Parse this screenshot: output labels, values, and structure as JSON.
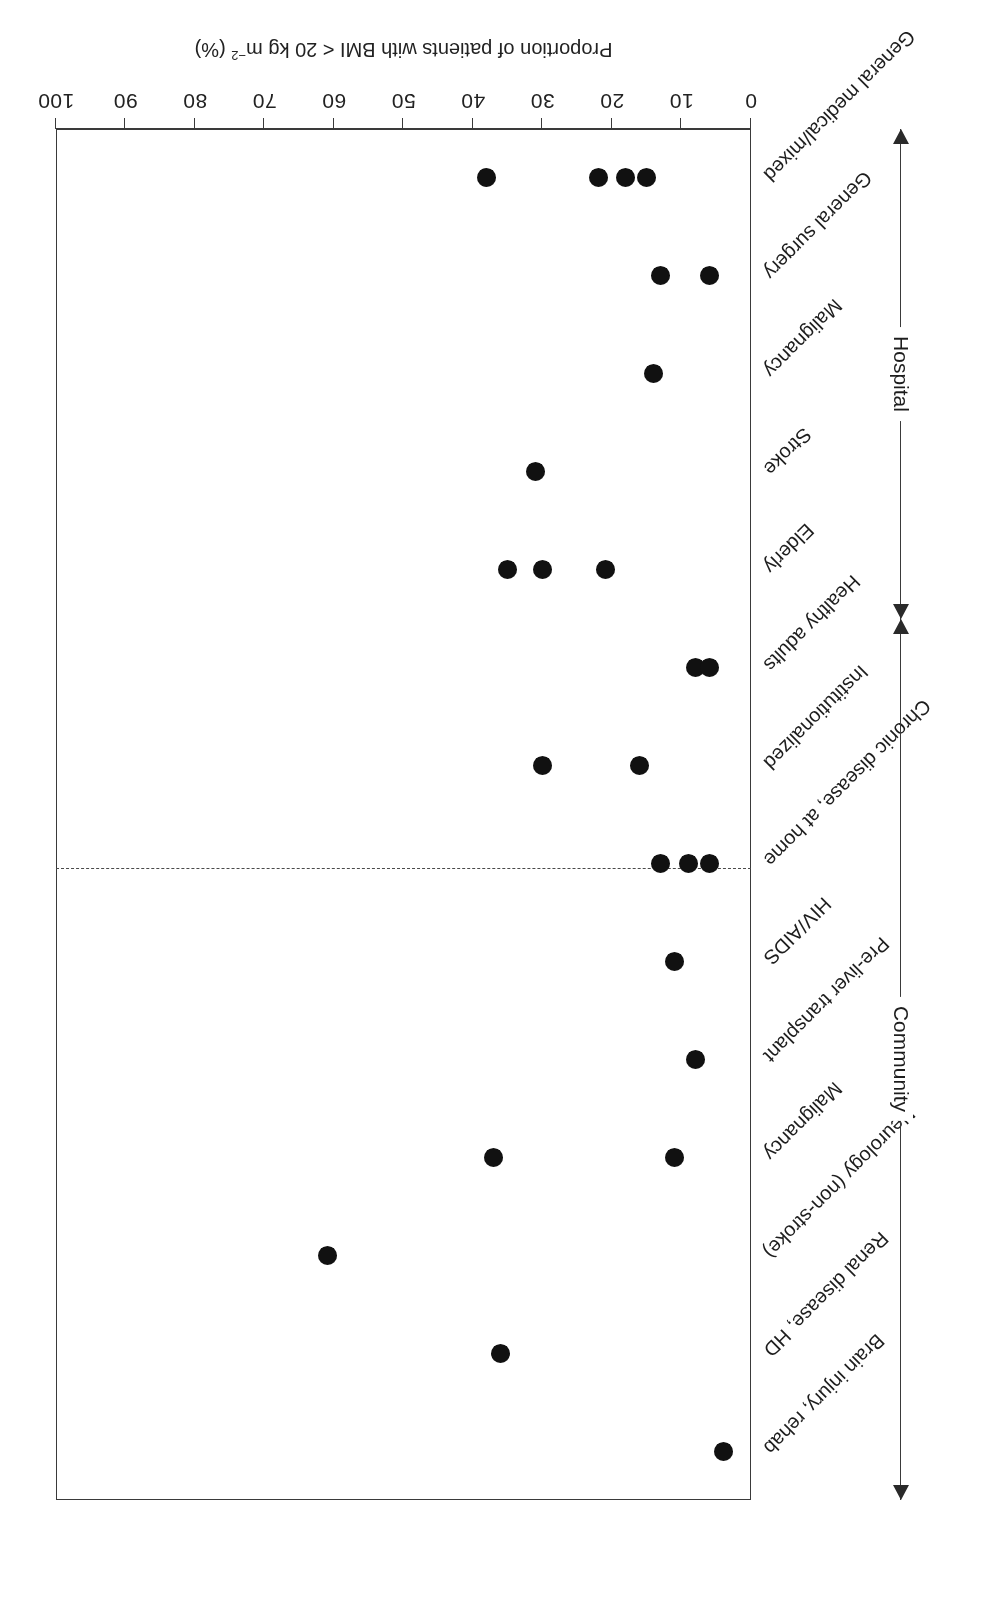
{
  "figure": {
    "orientation_note": "printed-upside-down",
    "axis_title": "Proportion of patients with BMI < 20 kg m",
    "axis_title_sup": "−2",
    "axis_title_suffix": " (%)",
    "group_labels": {
      "hospital": "Hospital",
      "community": "Community"
    }
  },
  "chart_data": {
    "type": "scatter",
    "title": "",
    "xlabel": "",
    "ylabel": "Proportion of patients with BMI < 20 kg m−2 (%)",
    "ylim": [
      0,
      100
    ],
    "yticks": [
      0,
      10,
      20,
      30,
      40,
      50,
      60,
      70,
      80,
      90,
      100
    ],
    "grid": false,
    "legend": "none",
    "groups": [
      {
        "name": "Hospital",
        "categories": [
          "General medical/mixed",
          "General surgery",
          "Malignancy",
          "Stroke",
          "Elderly"
        ]
      },
      {
        "name": "Community",
        "categories": [
          "Healthy adults",
          "Institutionalized",
          "Chronic disease, at home",
          "HIV/AIDS",
          "Pre-liver transplant",
          "Malignancy",
          "Neurology (non-stroke)",
          "Renal disease, HD",
          "Brain injury, rehab"
        ]
      }
    ],
    "categories": [
      "General medical/mixed",
      "General surgery",
      "Malignancy",
      "Stroke",
      "Elderly",
      "Healthy adults",
      "Institutionalized",
      "Chronic disease, at home",
      "HIV/AIDS",
      "Pre-liver transplant",
      "Malignancy",
      "Neurology (non-stroke)",
      "Renal disease, HD",
      "Brain injury, rehab"
    ],
    "points": [
      {
        "category": "General medical/mixed",
        "values": [
          38,
          22,
          18,
          15
        ]
      },
      {
        "category": "General surgery",
        "values": [
          13,
          6
        ]
      },
      {
        "category": "Malignancy",
        "values": [
          14
        ]
      },
      {
        "category": "Stroke",
        "values": [
          31
        ]
      },
      {
        "category": "Elderly",
        "values": [
          35,
          30,
          21
        ]
      },
      {
        "category": "Healthy adults",
        "values": [
          8,
          6
        ]
      },
      {
        "category": "Institutionalized",
        "values": [
          30,
          16
        ]
      },
      {
        "category": "Chronic disease, at home",
        "values": [
          13,
          9,
          6
        ]
      },
      {
        "category": "HIV/AIDS",
        "values": [
          11
        ]
      },
      {
        "category": "Pre-liver transplant",
        "values": [
          8
        ]
      },
      {
        "category": "Malignancy",
        "values": [
          37,
          11
        ]
      },
      {
        "category": "Neurology (non-stroke)",
        "values": [
          61
        ]
      },
      {
        "category": "Renal disease, HD",
        "values": [
          36
        ]
      },
      {
        "category": "Brain injury, rehab",
        "values": [
          4
        ]
      }
    ]
  }
}
